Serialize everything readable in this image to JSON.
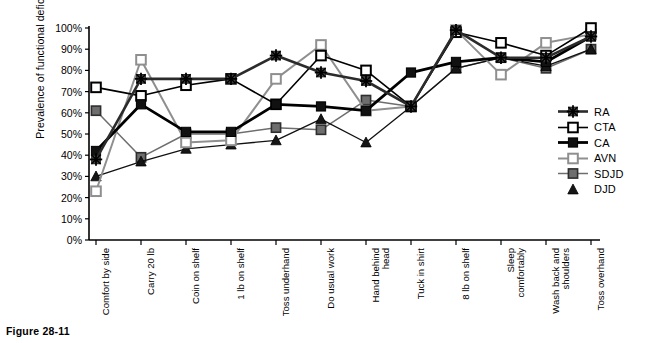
{
  "figure": {
    "caption": "Figure 28-11",
    "ylabel": "Prevalence of functional deficit"
  },
  "legend": {
    "position": "right",
    "items": [
      {
        "name": "RA",
        "marker": "star",
        "color": "#3a3a3a"
      },
      {
        "name": "CTA",
        "marker": "open-square",
        "color": "#000000"
      },
      {
        "name": "CA",
        "marker": "filled-square",
        "color": "#000000"
      },
      {
        "name": "AVN",
        "marker": "open-square",
        "color": "#8c8c8c"
      },
      {
        "name": "SDJD",
        "marker": "grey-square",
        "color": "#7a7a7a"
      },
      {
        "name": "DJD",
        "marker": "triangle",
        "color": "#1a1a1a"
      }
    ]
  },
  "chart_data": {
    "type": "line",
    "title": "",
    "xlabel": "",
    "ylabel": "Prevalence of functional deficit",
    "ylim": [
      0,
      100
    ],
    "yticks": [
      "0%",
      "10%",
      "20%",
      "30%",
      "40%",
      "50%",
      "60%",
      "70%",
      "80%",
      "90%",
      "100%"
    ],
    "ytick_values": [
      0,
      10,
      20,
      30,
      40,
      50,
      60,
      70,
      80,
      90,
      100
    ],
    "grid": false,
    "categories": [
      "Comfort by side",
      "Carry 20 lb",
      "Coin on shelf",
      "1 lb on shelf",
      "Toss underhand",
      "Do usual work",
      "Hand behind\nhead",
      "Tuck in shirt",
      "8 lb on shelf",
      "Sleep\ncomfortably",
      "Wash back and\nshoulders",
      "Toss overhand"
    ],
    "series": [
      {
        "name": "RA",
        "values": [
          38,
          76,
          76,
          76,
          87,
          79,
          75,
          63,
          99,
          86,
          86,
          96
        ]
      },
      {
        "name": "CTA",
        "values": [
          72,
          68,
          73,
          76,
          64,
          87,
          80,
          63,
          98,
          93,
          87,
          100
        ]
      },
      {
        "name": "CA",
        "values": [
          42,
          64,
          51,
          51,
          64,
          63,
          61,
          79,
          84,
          86,
          84,
          96
        ]
      },
      {
        "name": "AVN",
        "values": [
          23,
          85,
          46,
          47,
          76,
          92,
          61,
          63,
          99,
          78,
          93,
          97
        ]
      },
      {
        "name": "SDJD",
        "values": [
          61,
          39,
          50,
          50,
          53,
          52,
          66,
          63,
          81,
          86,
          81,
          90
        ]
      },
      {
        "name": "DJD",
        "values": [
          30,
          37,
          43,
          45,
          47,
          57,
          46,
          63,
          81,
          86,
          82,
          90
        ]
      }
    ]
  },
  "geometry": {
    "plot_left": 96,
    "plot_right": 591,
    "plot_top": 28,
    "plot_bottom": 240,
    "axis_x": 89,
    "col_spacing": 45
  }
}
